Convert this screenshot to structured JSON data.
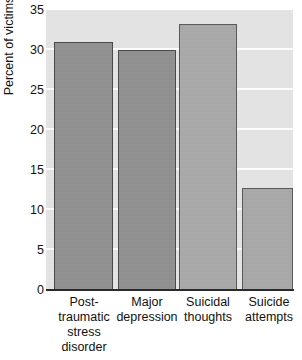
{
  "chart_data": {
    "type": "bar",
    "title": "",
    "subtitle": "",
    "xlabel": "",
    "ylabel": "Percent of victims",
    "categories": [
      "Post-traumatic stress disorder",
      "Major depression",
      "Suicidal thoughts",
      "Suicide attempts"
    ],
    "category_lines": [
      [
        "Post-",
        "traumatic",
        "stress",
        "disorder"
      ],
      [
        "Major",
        "depression"
      ],
      [
        "Suicidal",
        "thoughts"
      ],
      [
        "Suicide",
        "attempts"
      ]
    ],
    "values": [
      31.0,
      30.0,
      33.2,
      12.7
    ],
    "ylim": [
      0,
      35
    ],
    "yticks": [
      0,
      5,
      10,
      15,
      20,
      25,
      30,
      35
    ],
    "ytick_labels": [
      "0",
      "5",
      "10",
      "15",
      "20",
      "25",
      "30",
      "35"
    ],
    "grid": true,
    "grid_axis": "y",
    "legend": false,
    "legend_position": "none",
    "bar_color": "#919191",
    "bar_color_light": "#a9a9a9",
    "bar_edge_color": "#4a4a4a",
    "plot_background": "#e4e4e4",
    "gridline_color": "#fdfdfd",
    "axis_color": "#2a2a2a",
    "figure_background": "#ffffff"
  }
}
